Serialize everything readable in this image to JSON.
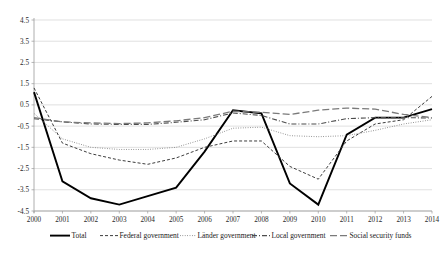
{
  "chart_data": {
    "type": "line",
    "title": "",
    "subtitle": "",
    "xlabel": "",
    "ylabel": "",
    "x": [
      2000,
      2001,
      2002,
      2003,
      2004,
      2005,
      2006,
      2007,
      2008,
      2009,
      2010,
      2011,
      2012,
      2013,
      2014
    ],
    "xtick_labels": [
      "2000",
      "2001",
      "2002",
      "2003",
      "2004",
      "2005",
      "2006",
      "2007",
      "2008",
      "2009",
      "2010",
      "2011",
      "2012",
      "2013",
      "2014"
    ],
    "ytick_labels": [
      "4.5",
      "3.5",
      "2.5",
      "1.5",
      "0.5",
      "-0.5",
      "-1.5",
      "-2.5",
      "-3.5",
      "-4.5"
    ],
    "ytick_values": [
      4.5,
      3.5,
      2.5,
      1.5,
      0.5,
      -0.5,
      -1.5,
      -2.5,
      -3.5,
      -4.5
    ],
    "ylim": [
      -4.5,
      4.5
    ],
    "xlim": [
      2000,
      2014
    ],
    "grid": true,
    "legend_position": "bottom",
    "series": [
      {
        "name": "Total",
        "style": "solid",
        "color": "#000000",
        "width": 1.9,
        "dash": "none",
        "values": [
          1.1,
          -3.1,
          -3.9,
          -4.2,
          -3.8,
          -3.4,
          -1.7,
          0.25,
          0.1,
          -3.2,
          -4.2,
          -0.9,
          -0.1,
          -0.1,
          0.3
        ]
      },
      {
        "name": "Federal government",
        "style": "dashed",
        "color": "#3d3d3d",
        "width": 1.0,
        "dash": "3,2",
        "values": [
          1.3,
          -1.3,
          -1.8,
          -2.1,
          -2.3,
          -2.0,
          -1.5,
          -1.2,
          -1.2,
          -2.4,
          -3.0,
          -1.2,
          -0.4,
          -0.2,
          0.9
        ]
      },
      {
        "name": "Länder government",
        "style": "dotted",
        "color": "#808080",
        "width": 1.0,
        "dash": "0.8,1.6",
        "values": [
          0.1,
          -1.1,
          -1.5,
          -1.6,
          -1.6,
          -1.5,
          -1.1,
          -0.6,
          -0.55,
          -0.95,
          -1.0,
          -0.95,
          -0.7,
          -0.4,
          -0.2
        ]
      },
      {
        "name": "Local government",
        "style": "dash-dot",
        "color": "#4d4d4d",
        "width": 1.1,
        "dash": "5,2,1,2",
        "values": [
          -0.15,
          -0.3,
          -0.4,
          -0.42,
          -0.42,
          -0.32,
          -0.2,
          0.12,
          0.0,
          -0.4,
          -0.4,
          -0.15,
          -0.1,
          -0.1,
          -0.12
        ]
      },
      {
        "name": "Social security funds",
        "style": "long-dash",
        "color": "#7a7a7a",
        "width": 1.3,
        "dash": "7,3",
        "values": [
          -0.1,
          -0.3,
          -0.35,
          -0.38,
          -0.35,
          -0.25,
          -0.1,
          0.2,
          0.15,
          0.05,
          0.25,
          0.35,
          0.3,
          0.05,
          -0.1
        ]
      }
    ]
  },
  "legend": {
    "items": [
      {
        "label": "Total"
      },
      {
        "label": "Federal government"
      },
      {
        "label": "Länder government"
      },
      {
        "label": "Local government"
      },
      {
        "label": "Social security funds"
      }
    ]
  }
}
